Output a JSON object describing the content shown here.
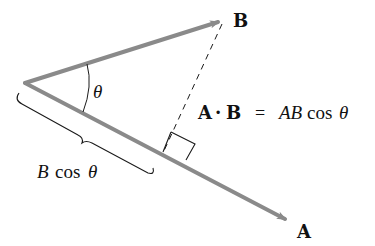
{
  "diagram": {
    "vectors": [
      {
        "name": "A",
        "label": "A",
        "from": [
          25,
          83
        ],
        "to": [
          291,
          222
        ],
        "color": "#8a8a8a"
      },
      {
        "name": "B",
        "label": "B",
        "from": [
          25,
          83
        ],
        "to": [
          224,
          20
        ],
        "color": "#8a8a8a"
      }
    ],
    "angle_label": "θ",
    "projection_label": {
      "B": "B",
      "cos": "cos",
      "theta": "θ"
    },
    "equation": {
      "lhs_A": "A",
      "dot": "·",
      "lhs_B": "B",
      "equals": "=",
      "rhs_AB": "AB",
      "rhs_cos": "cos",
      "rhs_theta": "θ"
    },
    "labels": {
      "A": "A",
      "B": "B"
    },
    "colors": {
      "vector": "#8a8a8a",
      "line": "#1a1a1a",
      "background": "#ffffff"
    }
  }
}
